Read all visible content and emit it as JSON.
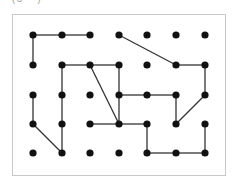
{
  "top_cropped_text": "(3   )",
  "diagram": {
    "grid": {
      "cols": 7,
      "rows": 5,
      "col_x": [
        33,
        62,
        90,
        119,
        147,
        176,
        205
      ],
      "row_y": [
        35,
        65,
        95,
        124,
        153
      ]
    },
    "dot_color": "#111111",
    "line_color": "#333333",
    "edges": [
      [
        [
          0,
          0
        ],
        [
          1,
          0
        ]
      ],
      [
        [
          1,
          0
        ],
        [
          2,
          0
        ]
      ],
      [
        [
          0,
          0
        ],
        [
          0,
          1
        ]
      ],
      [
        [
          3,
          0
        ],
        [
          5,
          1
        ]
      ],
      [
        [
          5,
          1
        ],
        [
          6,
          1
        ]
      ],
      [
        [
          6,
          1
        ],
        [
          6,
          2
        ]
      ],
      [
        [
          6,
          2
        ],
        [
          5,
          3
        ]
      ],
      [
        [
          5,
          3
        ],
        [
          5,
          2
        ]
      ],
      [
        [
          1,
          1
        ],
        [
          2,
          1
        ]
      ],
      [
        [
          2,
          1
        ],
        [
          3,
          1
        ]
      ],
      [
        [
          1,
          1
        ],
        [
          1,
          2
        ]
      ],
      [
        [
          1,
          2
        ],
        [
          1,
          3
        ]
      ],
      [
        [
          1,
          3
        ],
        [
          1,
          4
        ]
      ],
      [
        [
          2,
          1
        ],
        [
          3,
          3
        ]
      ],
      [
        [
          3,
          1
        ],
        [
          3,
          2
        ]
      ],
      [
        [
          3,
          2
        ],
        [
          3,
          3
        ]
      ],
      [
        [
          3,
          2
        ],
        [
          4,
          2
        ]
      ],
      [
        [
          4,
          2
        ],
        [
          5,
          2
        ]
      ],
      [
        [
          2,
          3
        ],
        [
          3,
          3
        ]
      ],
      [
        [
          3,
          3
        ],
        [
          4,
          3
        ]
      ],
      [
        [
          4,
          3
        ],
        [
          4,
          4
        ]
      ],
      [
        [
          4,
          4
        ],
        [
          5,
          4
        ]
      ],
      [
        [
          5,
          4
        ],
        [
          6,
          4
        ]
      ],
      [
        [
          6,
          4
        ],
        [
          6,
          3
        ]
      ],
      [
        [
          0,
          2
        ],
        [
          0,
          3
        ]
      ],
      [
        [
          0,
          3
        ],
        [
          1,
          4
        ]
      ]
    ]
  }
}
